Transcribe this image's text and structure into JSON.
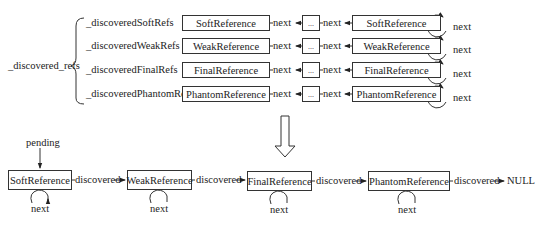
{
  "top": {
    "root_label": "_discovered_refs",
    "rows": [
      {
        "field": "_discoveredSoftRefs",
        "head": "SoftReference",
        "tail": "SoftReference",
        "link1": "next",
        "ellipsis": "...",
        "link2": "next",
        "self_link": "next"
      },
      {
        "field": "_discoveredWeakRefs",
        "head": "WeakReference",
        "tail": "WeakReference",
        "link1": "next",
        "ellipsis": "...",
        "link2": "next",
        "self_link": "next"
      },
      {
        "field": "_discoveredFinalRefs",
        "head": "FinalReference",
        "tail": "FinalReference",
        "link1": "next",
        "ellipsis": "...",
        "link2": "next",
        "self_link": "next"
      },
      {
        "field": "_discoveredPhantomRefs",
        "head": "PhantomReference",
        "tail": "PhantomReference",
        "link1": "next",
        "ellipsis": "...",
        "link2": "next",
        "self_link": "next"
      }
    ]
  },
  "bottom": {
    "pending_label": "pending",
    "nodes": [
      {
        "label": "SoftReference",
        "self_link": "next"
      },
      {
        "label": "WeakReference",
        "self_link": "next"
      },
      {
        "label": "FinalReference",
        "self_link": "next"
      },
      {
        "label": "PhantomReference",
        "self_link": "next"
      }
    ],
    "edges": [
      "discovered",
      "discovered",
      "discovered",
      "discovered"
    ],
    "terminal": "NULL"
  }
}
